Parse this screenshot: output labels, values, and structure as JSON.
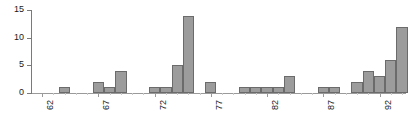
{
  "chart_data": {
    "type": "bar",
    "title": "",
    "subtitle": "",
    "xlabel": "",
    "ylabel": "",
    "grid": false,
    "legend": null,
    "orientation": "vertical",
    "bar_style": "histogram-adjacent",
    "colors": {
      "bar_fill": "#9c9c9c",
      "bar_edge": "#6b6b6b",
      "axis": "#7a7a7a",
      "text": "#1a1a1a",
      "background": "#ffffff"
    },
    "ylim": [
      0,
      15
    ],
    "yticks": [
      0,
      5,
      10,
      15
    ],
    "ytick_labels": [
      "0",
      "5",
      "10",
      "15"
    ],
    "xlim": [
      61.5,
      94.5
    ],
    "xticks": [
      62,
      67,
      72,
      77,
      82,
      87,
      92
    ],
    "xtick_labels": [
      "62",
      "67",
      "72",
      "77",
      "82",
      "87",
      "92"
    ],
    "xtick_label_rotation": 90,
    "bin_width": 1,
    "categories": [
      62,
      63,
      64,
      65,
      66,
      67,
      68,
      69,
      70,
      71,
      72,
      73,
      74,
      75,
      76,
      77,
      78,
      79,
      80,
      81,
      82,
      83,
      84,
      85,
      86,
      87,
      88,
      89,
      90,
      91,
      92,
      93,
      94
    ],
    "values": [
      0,
      0,
      1,
      0,
      0,
      2,
      1,
      4,
      0,
      0,
      1,
      1,
      5,
      14,
      0,
      2,
      0,
      0,
      1,
      1,
      1,
      1,
      3,
      0,
      0,
      1,
      1,
      0,
      2,
      4,
      3,
      6,
      12
    ],
    "series": [
      {
        "name": "frequency",
        "values": [
          0,
          0,
          1,
          0,
          0,
          2,
          1,
          4,
          0,
          0,
          1,
          1,
          5,
          14,
          0,
          2,
          0,
          0,
          1,
          1,
          1,
          1,
          3,
          0,
          0,
          1,
          1,
          0,
          2,
          4,
          3,
          6,
          12
        ]
      }
    ]
  }
}
